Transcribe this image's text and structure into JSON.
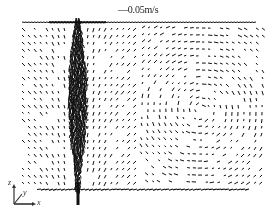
{
  "figure": {
    "type": "velocity-vector-field",
    "scale_reference": {
      "arrow": "—",
      "value": "0.05m/s"
    },
    "axes_triad": {
      "x_label": "x",
      "y_label": "y",
      "z_label": "z"
    },
    "colors": {
      "vectors": "#111111",
      "background": "#ffffff",
      "text": "#222222"
    },
    "field_region": {
      "left": 22,
      "top": 20,
      "right": 268,
      "bottom": 192
    },
    "jet": {
      "center_x": 78,
      "top_y": 18,
      "bottom_y": 205,
      "label": "central downward jet column"
    },
    "recirculation": {
      "center_x": 200,
      "center_y": 110,
      "direction": "counter-clockwise"
    }
  }
}
